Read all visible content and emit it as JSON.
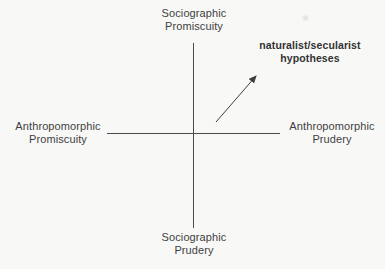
{
  "diagram": {
    "colors": {
      "background": "#f8f8f7",
      "text": "#3f3f3f",
      "axis_line": "#4a4a4a",
      "arrow": "#3f3f3f"
    },
    "axis_labels": {
      "top": {
        "line1": "Sociographic",
        "line2": "Promiscuity"
      },
      "bottom": {
        "line1": "Sociographic",
        "line2": "Prudery"
      },
      "left": {
        "line1": "Anthropomorphic",
        "line2": "Promiscuity"
      },
      "right": {
        "line1": "Anthropomorphic",
        "line2": "Prudery"
      }
    },
    "annotation": {
      "line1": "naturalist/secularist",
      "line2": "hypotheses"
    }
  }
}
